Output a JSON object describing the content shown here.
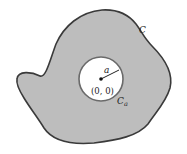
{
  "diagram": {
    "outer_curve_label": "C",
    "inner_circle_label": "C",
    "inner_circle_label_subscript": "a",
    "radius_label": "a",
    "center_label": "(0, 0)",
    "colors": {
      "region_fill": "#bdbdbd",
      "stroke": "#3a3a3a",
      "hole_fill": "#ffffff"
    }
  }
}
